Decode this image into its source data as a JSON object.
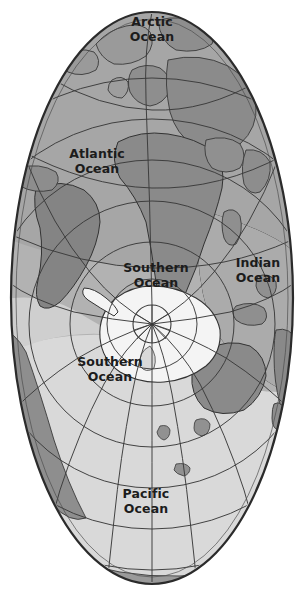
{
  "map": {
    "title": "Oval world map centred on the South Pole",
    "projection": "oval / elliptical south-polar azimuthal",
    "background_color": "#ffffff",
    "colors": {
      "ocean_upper": "#a8a8a8",
      "ocean_mid": "#b4b4b4",
      "ocean_lower": "#d8d8d8",
      "land_dark": "#8a8a8a",
      "land_mid": "#9c9c9c",
      "antarctica": "#f2f2f2",
      "graticule": "#3a3a3a",
      "outline": "#2b2b2b",
      "label_text": "#1c1c1c"
    },
    "geometry": {
      "oval_center_x": 152,
      "oval_center_y": 298,
      "oval_radius_x": 141,
      "oval_radius_y": 286,
      "pole_center_x": 152,
      "pole_center_y": 324,
      "pole_circle_radius": 19
    },
    "labels": [
      {
        "id": "arctic-ocean",
        "text_line1": "Arctic",
        "text_line2": "Ocean",
        "x": 152,
        "y": 26,
        "line_gap": 15
      },
      {
        "id": "atlantic-ocean",
        "text_line1": "Atlantic",
        "text_line2": "Ocean",
        "x": 97,
        "y": 158,
        "line_gap": 15
      },
      {
        "id": "indian-ocean",
        "text_line1": "Indian",
        "text_line2": "Ocean",
        "x": 258,
        "y": 267,
        "line_gap": 15
      },
      {
        "id": "southern-ocean-north",
        "text_line1": "Southern",
        "text_line2": "Ocean",
        "x": 156,
        "y": 272,
        "line_gap": 15
      },
      {
        "id": "southern-ocean-west",
        "text_line1": "Southern",
        "text_line2": "Ocean",
        "x": 110,
        "y": 366,
        "line_gap": 15
      },
      {
        "id": "pacific-ocean",
        "text_line1": "Pacific",
        "text_line2": "Ocean",
        "x": 146,
        "y": 498,
        "line_gap": 15
      }
    ],
    "graticule": {
      "latitude_circles": [
        {
          "name": "outer-ring-1",
          "rx": 138,
          "ry": 280
        },
        {
          "name": "lat-circle-1",
          "r": 246
        },
        {
          "name": "lat-circle-2",
          "r": 205
        },
        {
          "name": "lat-circle-3",
          "r": 164
        },
        {
          "name": "lat-circle-4",
          "r": 123
        },
        {
          "name": "lat-circle-5",
          "r": 82
        },
        {
          "name": "lat-circle-6",
          "r": 45
        },
        {
          "name": "lat-circle-7",
          "r": 19
        }
      ],
      "meridian_count": 12,
      "meridian_spacing_degrees": 30
    }
  }
}
